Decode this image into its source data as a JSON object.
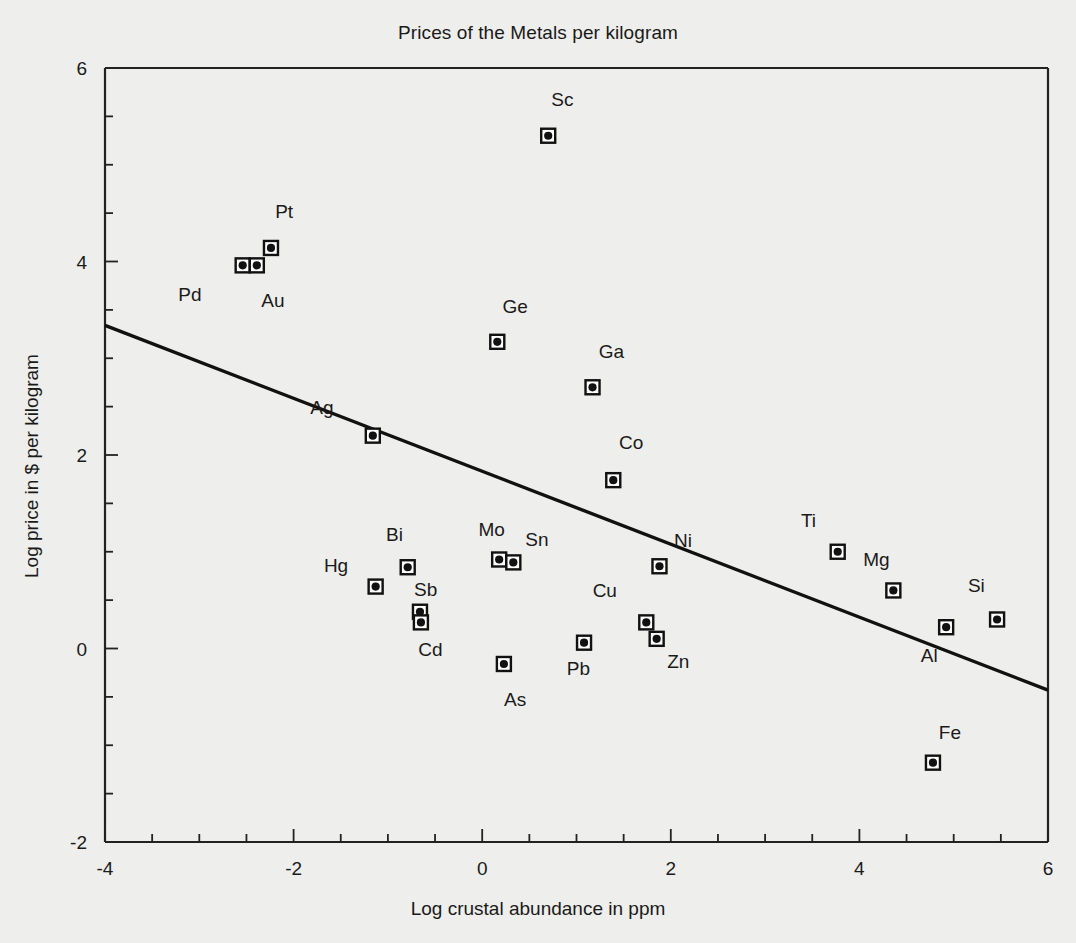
{
  "chart_data": {
    "type": "scatter",
    "title": "Prices of the Metals per kilogram",
    "xlabel": "Log crustal abundance in ppm",
    "ylabel": "Log price in $ per kilogram",
    "xlim": [
      -4,
      6
    ],
    "ylim": [
      -2,
      6
    ],
    "xticks": [
      -4,
      -2,
      0,
      2,
      4,
      6
    ],
    "xtick_labels": [
      "-4",
      "-2",
      "0",
      "2",
      "4",
      "6"
    ],
    "yticks": [
      -2,
      0,
      2,
      4,
      6
    ],
    "ytick_labels": [
      "-2",
      "0",
      "2",
      "4",
      "6"
    ],
    "minor_tick_step": 0.5,
    "grid": false,
    "legend": "none",
    "marker_style": "filled-circle-in-open-square",
    "points": [
      {
        "label": "Sc",
        "x": 0.7,
        "y": 5.3,
        "lx": 0.85,
        "ly": 5.68
      },
      {
        "label": "Pt",
        "x": -2.24,
        "y": 4.14,
        "lx": -2.1,
        "ly": 4.52
      },
      {
        "label": "Pd",
        "x": -2.54,
        "y": 3.96,
        "lx": -3.1,
        "ly": 3.66
      },
      {
        "label": "Au",
        "x": -2.39,
        "y": 3.96,
        "lx": -2.22,
        "ly": 3.6
      },
      {
        "label": "Ge",
        "x": 0.16,
        "y": 3.17,
        "lx": 0.35,
        "ly": 3.54
      },
      {
        "label": "Ga",
        "x": 1.17,
        "y": 2.7,
        "lx": 1.37,
        "ly": 3.08
      },
      {
        "label": "Co",
        "x": 1.39,
        "y": 1.74,
        "lx": 1.58,
        "ly": 2.13
      },
      {
        "label": "Ag",
        "x": -1.16,
        "y": 2.2,
        "lx": -1.7,
        "ly": 2.5
      },
      {
        "label": "Ti",
        "x": 3.77,
        "y": 1.0,
        "lx": 3.46,
        "ly": 1.33
      },
      {
        "label": "Mo",
        "x": 0.18,
        "y": 0.92,
        "lx": 0.1,
        "ly": 1.24
      },
      {
        "label": "Sn",
        "x": 0.33,
        "y": 0.89,
        "lx": 0.58,
        "ly": 1.13
      },
      {
        "label": "Bi",
        "x": -0.79,
        "y": 0.84,
        "lx": -0.93,
        "ly": 1.18
      },
      {
        "label": "Ni",
        "x": 1.88,
        "y": 0.85,
        "lx": 2.13,
        "ly": 1.12
      },
      {
        "label": "Hg",
        "x": -1.13,
        "y": 0.64,
        "lx": -1.55,
        "ly": 0.86
      },
      {
        "label": "Mg",
        "x": 4.36,
        "y": 0.6,
        "lx": 4.18,
        "ly": 0.92
      },
      {
        "label": "Si",
        "x": 5.46,
        "y": 0.3,
        "lx": 5.24,
        "ly": 0.66
      },
      {
        "label": "Cu",
        "x": 1.74,
        "y": 0.27,
        "lx": 1.3,
        "ly": 0.6
      },
      {
        "label": "Sb",
        "x": -0.66,
        "y": 0.38,
        "lx": -0.6,
        "ly": 0.62
      },
      {
        "label": "Cd",
        "x": -0.65,
        "y": 0.27,
        "lx": -0.55,
        "ly": 0.0
      },
      {
        "label": "Al",
        "x": 4.92,
        "y": 0.22,
        "lx": 4.74,
        "ly": -0.07
      },
      {
        "label": "Zn",
        "x": 1.85,
        "y": 0.1,
        "lx": 2.08,
        "ly": -0.13
      },
      {
        "label": "Pb",
        "x": 1.08,
        "y": 0.06,
        "lx": 1.02,
        "ly": -0.2
      },
      {
        "label": "As",
        "x": 0.23,
        "y": -0.16,
        "lx": 0.35,
        "ly": -0.52
      },
      {
        "label": "Fe",
        "x": 4.78,
        "y": -1.18,
        "lx": 4.96,
        "ly": -0.86
      }
    ],
    "fit_line": {
      "x0": -4,
      "y0": 3.34,
      "x1": 6,
      "y1": -0.43
    }
  }
}
